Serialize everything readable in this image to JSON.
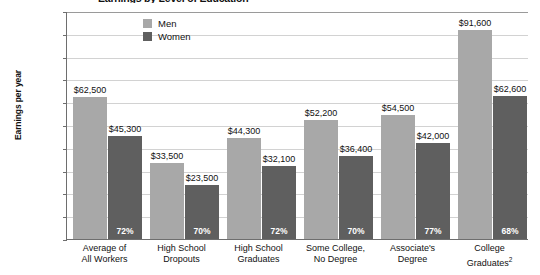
{
  "chart_data": {
    "type": "bar",
    "title": "Earnings by Level of Education",
    "xlabel": "",
    "ylabel": "Earnings per year",
    "ylim": [
      0,
      100000
    ],
    "ytick_labels": [
      "$100,000",
      "$90,000",
      "$80,000",
      "$70,000",
      "$60,000",
      "$50,000",
      "$40,000",
      "$30,000",
      "$20,000",
      "$10,000",
      "0"
    ],
    "ytick_values": [
      100000,
      90000,
      80000,
      70000,
      60000,
      50000,
      40000,
      30000,
      20000,
      10000,
      0
    ],
    "grid": true,
    "legend_position": "top-center",
    "categories": [
      "Average of\nAll Workers",
      "High School\nDropouts",
      "High School\nGraduates",
      "Some College,\nNo Degree",
      "Associate's\nDegree",
      "College\nGraduates"
    ],
    "category_footnotes": [
      "",
      "",
      "",
      "",
      "",
      "2"
    ],
    "series": [
      {
        "name": "Men",
        "color": "#a8a8a8",
        "values": [
          62500,
          33500,
          44300,
          52200,
          54500,
          91600
        ],
        "value_labels": [
          "$62,500",
          "$33,500",
          "$44,300",
          "$52,200",
          "$54,500",
          "$91,600"
        ]
      },
      {
        "name": "Women",
        "color": "#5f5f5f",
        "values": [
          45300,
          23500,
          32100,
          36400,
          42000,
          62600
        ],
        "value_labels": [
          "$45,300",
          "$23,500",
          "$32,100",
          "$36,400",
          "$42,000",
          "$62,600"
        ],
        "ratio_labels": [
          "72%",
          "70%",
          "72%",
          "70%",
          "77%",
          "68%"
        ]
      }
    ]
  },
  "legend": {
    "items": [
      {
        "label": "Men"
      },
      {
        "label": "Women"
      }
    ]
  },
  "colors": {
    "men": "#a8a8a8",
    "women": "#5f5f5f",
    "axis": "#6e6e6e",
    "grid": "#d2d2d2",
    "text": "#111111",
    "pct_text": "#ffffff"
  }
}
